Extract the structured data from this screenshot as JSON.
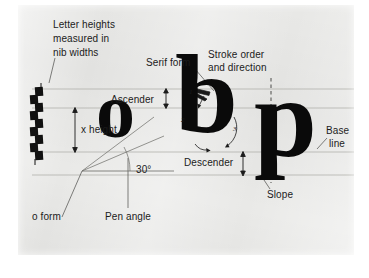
{
  "figure": {
    "background_color": "#e9e9e7",
    "ink_color": "#0a0a0a",
    "guide_line_color": "#a8a8a4",
    "labels": {
      "letter_heights_line1": "Letter heights",
      "letter_heights_line2": "measured in",
      "letter_heights_line3": "nib widths",
      "x_height": "x height",
      "o_form": "o form",
      "pen_angle": "Pen angle",
      "pen_angle_value": "30°",
      "ascender": "Ascender",
      "serif_form": "Serif form",
      "stroke_order_line1": "Stroke order",
      "stroke_order_line2": "and direction",
      "descender": "Descender",
      "base_line_1": "Base",
      "base_line_2": "line",
      "slope": "Slope"
    },
    "letters": [
      {
        "char": "o",
        "name": "letter-o"
      },
      {
        "char": "b",
        "name": "letter-b"
      },
      {
        "char": "p",
        "name": "letter-p"
      }
    ],
    "stroke_numbers": [
      "1",
      "2",
      "3"
    ],
    "nib_ladder_squares": 9,
    "guide_lines": [
      "ascender-line",
      "x-height-line",
      "base-line",
      "descender-line"
    ]
  }
}
